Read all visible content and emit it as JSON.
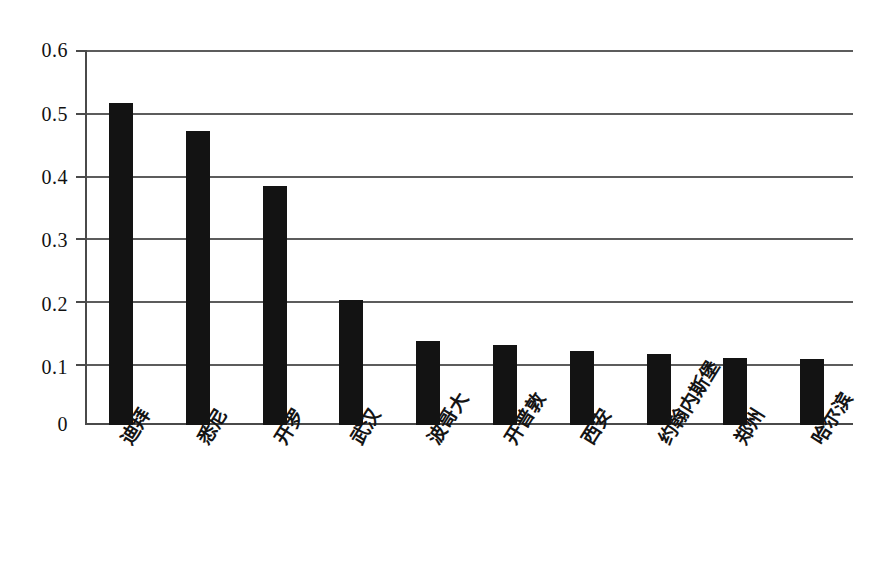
{
  "chart_data": {
    "type": "bar",
    "title": "",
    "subtitle": "",
    "xlabel": "",
    "ylabel": "",
    "categories": [
      "迪拜",
      "悉尼",
      "开罗",
      "武汉",
      "波哥大",
      "开普敦",
      "西安",
      "约翰内斯堡",
      "郑州",
      "哈尔滨"
    ],
    "values": [
      0.515,
      0.47,
      0.382,
      0.2,
      0.135,
      0.128,
      0.118,
      0.114,
      0.108,
      0.105
    ],
    "ylim": [
      0,
      0.6
    ],
    "ytick_labels": [
      "0.6",
      "0.5",
      "0.4",
      "0.3",
      "0.2",
      "0.1",
      "0"
    ],
    "ytick_values": [
      0.6,
      0.5,
      0.4,
      0.3,
      0.2,
      0.1,
      0
    ],
    "grid": true,
    "grid_axis": "y",
    "legend": false,
    "legend_position": "none",
    "bar_color": "#131313",
    "axis_color": "#4a4a4a",
    "grid_color": "#5c5c5c",
    "background_color": "#ffffff",
    "xtick_rotation": -58
  }
}
